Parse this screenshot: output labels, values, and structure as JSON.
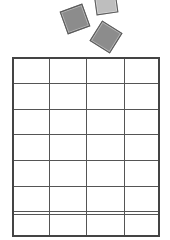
{
  "tiles": [
    {
      "id": "tile-1",
      "cx": 75,
      "cy": 19,
      "size": 24,
      "rotation": -20,
      "color": "#8c8c8c"
    },
    {
      "id": "tile-2",
      "cx": 106,
      "cy": 3,
      "size": 22,
      "rotation": -8,
      "color": "#bebebe"
    },
    {
      "id": "tile-3",
      "cx": 106,
      "cy": 37,
      "size": 24,
      "rotation": 32,
      "color": "#8c8c8c"
    }
  ],
  "board": {
    "columns": 4,
    "rows": 7,
    "col_edges": [
      0,
      37,
      74,
      112,
      148
    ],
    "row_edges": [
      0,
      26,
      52,
      77,
      103,
      129,
      154,
      180
    ],
    "double_line_row": 6,
    "line_color": "#555555",
    "border_color": "#444444"
  }
}
